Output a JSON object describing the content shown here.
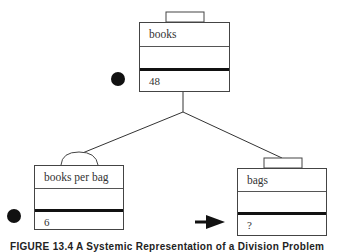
{
  "diagram": {
    "nodes": [
      {
        "id": "books",
        "label": "books",
        "value": "48",
        "marker": "dot",
        "handle": "rect"
      },
      {
        "id": "books_per_bag",
        "label": "books per bag",
        "value": "6",
        "marker": "dot",
        "handle": "arc"
      },
      {
        "id": "bags",
        "label": "bags",
        "value": "?",
        "marker": "arrow",
        "handle": "rect"
      }
    ],
    "edges": [
      {
        "from": "books",
        "to": "books_per_bag"
      },
      {
        "from": "books",
        "to": "bags"
      }
    ],
    "caption": "FIGURE 13.4  A Systemic Representation of a Division Problem"
  }
}
